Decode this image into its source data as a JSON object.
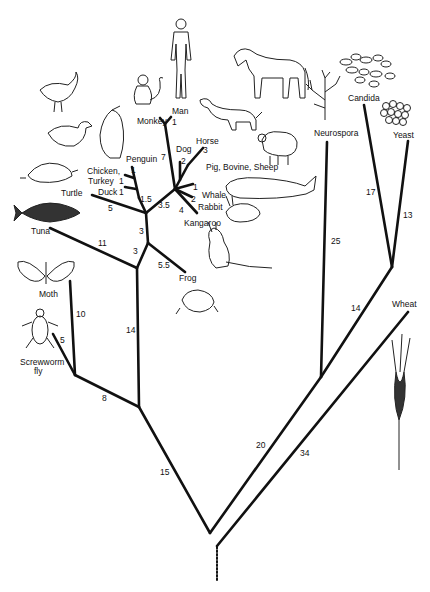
{
  "diagram": {
    "type": "phylogenetic-tree",
    "taxa": {
      "man": "Man",
      "monkey": "Monkey",
      "dog": "Dog",
      "horse": "Horse",
      "pig_bovine_sheep": "Pig, Bovine, Sheep",
      "whale": "Whale",
      "rabbit": "Rabbit",
      "kangaroo": "Kangaroo",
      "chicken_turkey_1": "Chicken,",
      "chicken_turkey_2": "Turkey",
      "penguin": "Penguin",
      "duck": "Duck",
      "turtle": "Turtle",
      "tuna": "Tuna",
      "frog": "Frog",
      "moth": "Moth",
      "screwworm_1": "Screwworm",
      "screwworm_2": "fly",
      "neurospora": "Neurospora",
      "candida": "Candida",
      "yeast": "Yeast",
      "wheat": "Wheat"
    },
    "branch_lengths": {
      "man": "1",
      "monkey_man_stem": "7",
      "dog": "2",
      "horse": "3",
      "pig": "1",
      "whale_rabbit": "2",
      "kangaroo": "4",
      "mammals": "3.5",
      "penguin": "1",
      "chicken": "1",
      "duck": "1",
      "birds": "1.5",
      "turtle": "5",
      "amniotes": "3",
      "tetrapods": "3",
      "frog": "5.5",
      "tuna": "11",
      "vertebrates": "14",
      "moth": "10",
      "screwworm": "5",
      "insects": "8",
      "animals": "15",
      "neurospora": "25",
      "candida": "17",
      "yeast": "13",
      "yeasts_stem": "14",
      "fungi": "20",
      "wheat": "34"
    }
  }
}
